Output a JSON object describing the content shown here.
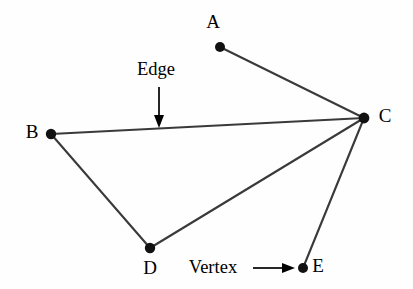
{
  "diagram": {
    "background_color": "#fefefe",
    "edge_color": "#3a3a3a",
    "vertex_color": "#111111",
    "text_color": "#000000",
    "width": 413,
    "height": 289,
    "vertices": [
      {
        "id": "A",
        "label": "A",
        "cx": 220,
        "cy": 47,
        "r": 5.0,
        "label_x": 213,
        "label_y": 24
      },
      {
        "id": "B",
        "label": "B",
        "cx": 51,
        "cy": 134,
        "r": 5.2,
        "label_x": 32,
        "label_y": 134
      },
      {
        "id": "C",
        "label": "C",
        "cx": 364,
        "cy": 118,
        "r": 5.4,
        "label_x": 385,
        "label_y": 118
      },
      {
        "id": "D",
        "label": "D",
        "cx": 150,
        "cy": 248,
        "r": 5.2,
        "label_x": 150,
        "label_y": 270
      },
      {
        "id": "E",
        "label": "E",
        "cx": 303,
        "cy": 268,
        "r": 5.0,
        "label_x": 318,
        "label_y": 268
      }
    ],
    "edges": [
      {
        "id": "edge-a-c",
        "from": "A",
        "to": "C",
        "x1": 220,
        "y1": 47,
        "x2": 364,
        "y2": 118
      },
      {
        "id": "edge-b-c",
        "from": "B",
        "to": "C",
        "x1": 51,
        "y1": 134,
        "x2": 364,
        "y2": 118
      },
      {
        "id": "edge-b-d",
        "from": "B",
        "to": "D",
        "x1": 51,
        "y1": 134,
        "x2": 150,
        "y2": 248
      },
      {
        "id": "edge-d-c",
        "from": "D",
        "to": "C",
        "x1": 150,
        "y1": 248,
        "x2": 364,
        "y2": 118
      },
      {
        "id": "edge-e-c",
        "from": "E",
        "to": "C",
        "x1": 303,
        "y1": 268,
        "x2": 364,
        "y2": 118
      }
    ],
    "annotations": [
      {
        "id": "edge-annotation",
        "label": "Edge",
        "text_x": 156,
        "text_y": 71,
        "pointer": {
          "direction": "down",
          "x1": 159,
          "y1": 87,
          "x2": 159,
          "y2": 120,
          "head": "159,128 154,115 164,115"
        }
      },
      {
        "id": "vertex-annotation",
        "label": "Vertex",
        "text_x": 213,
        "text_y": 269,
        "pointer": {
          "direction": "right",
          "x1": 253,
          "y1": 268,
          "x2": 284,
          "y2": 268,
          "head": "295,268 282,263 282,273"
        }
      }
    ]
  }
}
